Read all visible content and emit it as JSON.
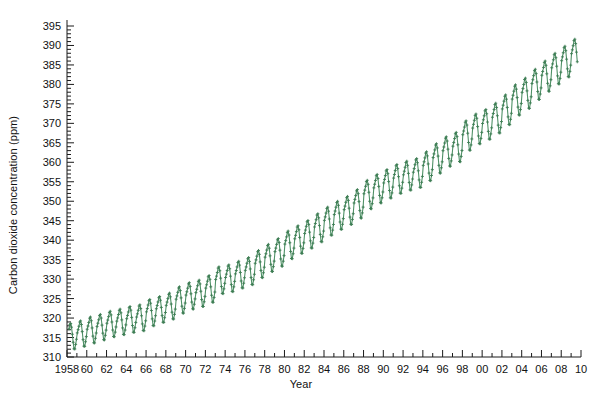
{
  "chart_data": {
    "type": "line",
    "title": "",
    "xlabel": "Year",
    "ylabel": "Carbon dioxide concentration (ppm)",
    "xlim": [
      1958,
      2010
    ],
    "ylim": [
      310,
      395
    ],
    "y_major_step": 5,
    "y_minor_step": 1,
    "x_major_step": 2,
    "x_minor_step": 1,
    "grid": false,
    "legend": null,
    "series_name": "Mauna Loa monthly mean CO2",
    "line_color": "#4f9167",
    "marker": "plus",
    "marker_color": "#3d7d54",
    "ytick_labels": [
      "310",
      "315",
      "320",
      "325",
      "330",
      "335",
      "340",
      "345",
      "350",
      "355",
      "360",
      "365",
      "370",
      "375",
      "380",
      "385",
      "390",
      "395"
    ],
    "xtick_labels": [
      "1958",
      "60",
      "62",
      "64",
      "66",
      "68",
      "70",
      "72",
      "74",
      "76",
      "78",
      "80",
      "82",
      "84",
      "86",
      "88",
      "90",
      "92",
      "94",
      "96",
      "98",
      "00",
      "02",
      "04",
      "06",
      "08",
      "10"
    ],
    "annual_means": [
      {
        "year": 1958,
        "value": 315.3,
        "amplitude": 5.9
      },
      {
        "year": 1959,
        "value": 315.98,
        "amplitude": 5.9
      },
      {
        "year": 1960,
        "value": 316.91,
        "amplitude": 6.0
      },
      {
        "year": 1961,
        "value": 317.64,
        "amplitude": 5.9
      },
      {
        "year": 1962,
        "value": 318.45,
        "amplitude": 5.9
      },
      {
        "year": 1963,
        "value": 318.99,
        "amplitude": 5.9
      },
      {
        "year": 1964,
        "value": 319.62,
        "amplitude": 6.0
      },
      {
        "year": 1965,
        "value": 320.04,
        "amplitude": 6.0
      },
      {
        "year": 1966,
        "value": 321.37,
        "amplitude": 6.1
      },
      {
        "year": 1967,
        "value": 322.18,
        "amplitude": 6.0
      },
      {
        "year": 1968,
        "value": 323.05,
        "amplitude": 6.0
      },
      {
        "year": 1969,
        "value": 324.62,
        "amplitude": 6.1
      },
      {
        "year": 1970,
        "value": 325.68,
        "amplitude": 6.1
      },
      {
        "year": 1971,
        "value": 326.32,
        "amplitude": 6.1
      },
      {
        "year": 1972,
        "value": 327.46,
        "amplitude": 6.2
      },
      {
        "year": 1973,
        "value": 329.68,
        "amplitude": 6.2
      },
      {
        "year": 1974,
        "value": 330.19,
        "amplitude": 6.2
      },
      {
        "year": 1975,
        "value": 331.12,
        "amplitude": 6.2
      },
      {
        "year": 1976,
        "value": 332.03,
        "amplitude": 6.3
      },
      {
        "year": 1977,
        "value": 333.84,
        "amplitude": 6.3
      },
      {
        "year": 1978,
        "value": 335.41,
        "amplitude": 6.3
      },
      {
        "year": 1979,
        "value": 336.84,
        "amplitude": 6.4
      },
      {
        "year": 1980,
        "value": 338.76,
        "amplitude": 6.4
      },
      {
        "year": 1981,
        "value": 340.12,
        "amplitude": 6.4
      },
      {
        "year": 1982,
        "value": 341.48,
        "amplitude": 6.4
      },
      {
        "year": 1983,
        "value": 343.15,
        "amplitude": 6.5
      },
      {
        "year": 1984,
        "value": 344.85,
        "amplitude": 6.5
      },
      {
        "year": 1985,
        "value": 346.35,
        "amplitude": 6.5
      },
      {
        "year": 1986,
        "value": 347.61,
        "amplitude": 6.5
      },
      {
        "year": 1987,
        "value": 349.31,
        "amplitude": 6.6
      },
      {
        "year": 1988,
        "value": 351.69,
        "amplitude": 6.6
      },
      {
        "year": 1989,
        "value": 353.2,
        "amplitude": 6.6
      },
      {
        "year": 1990,
        "value": 354.45,
        "amplitude": 6.6
      },
      {
        "year": 1991,
        "value": 355.7,
        "amplitude": 6.7
      },
      {
        "year": 1992,
        "value": 356.54,
        "amplitude": 6.7
      },
      {
        "year": 1993,
        "value": 357.21,
        "amplitude": 6.7
      },
      {
        "year": 1994,
        "value": 358.96,
        "amplitude": 6.7
      },
      {
        "year": 1995,
        "value": 360.97,
        "amplitude": 6.8
      },
      {
        "year": 1996,
        "value": 362.74,
        "amplitude": 6.8
      },
      {
        "year": 1997,
        "value": 363.88,
        "amplitude": 6.8
      },
      {
        "year": 1998,
        "value": 366.84,
        "amplitude": 6.8
      },
      {
        "year": 1999,
        "value": 368.54,
        "amplitude": 6.9
      },
      {
        "year": 2000,
        "value": 369.71,
        "amplitude": 6.9
      },
      {
        "year": 2001,
        "value": 371.32,
        "amplitude": 6.9
      },
      {
        "year": 2002,
        "value": 373.45,
        "amplitude": 6.9
      },
      {
        "year": 2003,
        "value": 375.98,
        "amplitude": 7.0
      },
      {
        "year": 2004,
        "value": 377.7,
        "amplitude": 7.0
      },
      {
        "year": 2005,
        "value": 379.98,
        "amplitude": 7.0
      },
      {
        "year": 2006,
        "value": 382.09,
        "amplitude": 7.0
      },
      {
        "year": 2007,
        "value": 384.02,
        "amplitude": 7.1
      },
      {
        "year": 2008,
        "value": 385.83,
        "amplitude": 7.1
      },
      {
        "year": 2009,
        "value": 387.64,
        "amplitude": 7.1
      }
    ],
    "seasonal_shape": [
      0.22,
      1.05,
      1.95,
      3.05,
      3.35,
      2.4,
      0.55,
      -1.55,
      -3.25,
      -3.3,
      -2.1,
      -0.75
    ]
  }
}
